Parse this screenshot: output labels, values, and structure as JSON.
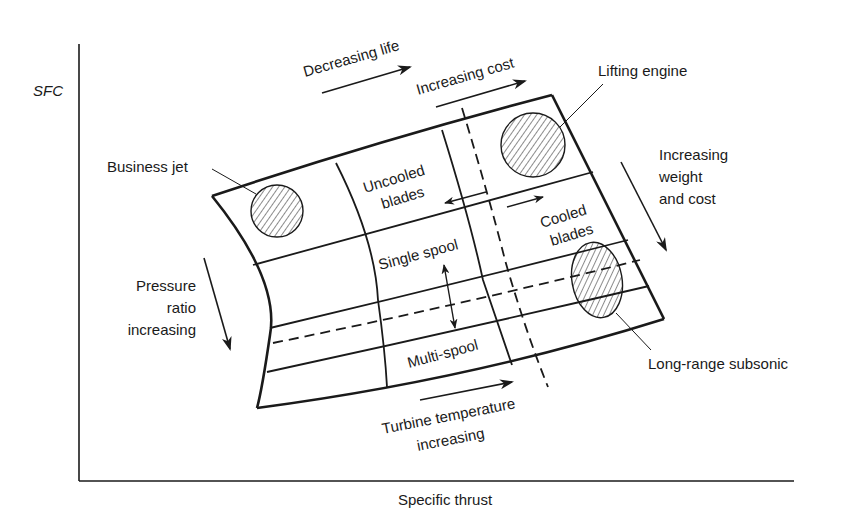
{
  "axes": {
    "y_label": "SFC",
    "x_label": "Specific thrust"
  },
  "top_arrows": {
    "decreasing_life": "Decreasing life",
    "increasing_cost": "Increasing cost"
  },
  "right_arrow": {
    "line1": "Increasing",
    "line2": "weight",
    "line3": "and cost"
  },
  "left_arrow": {
    "line1": "Pressure",
    "line2": "ratio",
    "line3": "increasing"
  },
  "bottom_arrow": {
    "line1": "Turbine temperature",
    "line2": "increasing"
  },
  "regions": {
    "uncooled_line1": "Uncooled",
    "uncooled_line2": "blades",
    "cooled_line1": "Cooled",
    "cooled_line2": "blades",
    "single_spool": "Single spool",
    "multi_spool": "Multi-spool"
  },
  "callouts": {
    "business_jet": "Business jet",
    "lifting_engine": "Lifting engine",
    "long_range_subsonic": "Long-range subsonic"
  },
  "colors": {
    "ink": "#1a1a1a",
    "background": "#ffffff"
  }
}
